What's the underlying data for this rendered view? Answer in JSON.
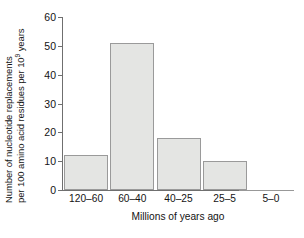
{
  "chart_data": {
    "type": "bar",
    "title": "",
    "categories": [
      "120–60",
      "60–40",
      "40–25",
      "25–5",
      "5–0"
    ],
    "values": [
      12,
      51,
      18,
      10,
      0
    ],
    "xlabel": "Millions of years ago",
    "ylabel_line1": "Number of nucleotide replacements",
    "ylabel_line2_pre": "per 100 amino acid residues per 10",
    "ylabel_line2_sup": "9",
    "ylabel_line2_post": " years",
    "yticks": [
      0,
      10,
      20,
      30,
      40,
      50,
      60
    ],
    "ytick_labels": [
      "0",
      "10",
      "20",
      "30",
      "40",
      "50",
      "60"
    ],
    "ylim": [
      0,
      60
    ],
    "grid": false,
    "legend": "none",
    "bar_fill_color": "#e4e5e3",
    "bar_border_color": "#9a9a9a",
    "axis_color": "#6f6f6f",
    "text_color": "#131313"
  }
}
